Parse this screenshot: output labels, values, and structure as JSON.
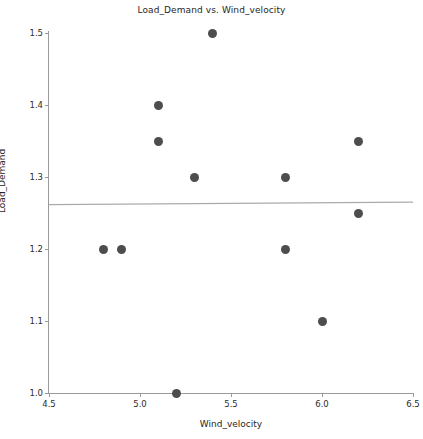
{
  "chart_data": {
    "type": "scatter",
    "title": "Load_Demand vs. Wind_velocity",
    "xlabel": "Wind_velocity",
    "ylabel": "Load_Demand",
    "xlim": [
      4.5,
      6.5
    ],
    "ylim": [
      1.0,
      1.5
    ],
    "xticks": [
      "4.5",
      "5.0",
      "5.5",
      "6.0",
      "6.5"
    ],
    "xtick_values": [
      4.5,
      5.0,
      5.5,
      6.0,
      6.5
    ],
    "yticks": [
      "1.0",
      "1.1",
      "1.2",
      "1.3",
      "1.4",
      "1.5"
    ],
    "ytick_values": [
      1.0,
      1.1,
      1.2,
      1.3,
      1.4,
      1.5
    ],
    "grid": false,
    "legend": "none",
    "marker_color": "#4d4d4d",
    "line_color": "#aaaaaa",
    "axis_color": "#9a9a9a",
    "x": [
      4.8,
      4.9,
      5.1,
      5.1,
      5.2,
      5.3,
      5.4,
      5.8,
      5.8,
      6.0,
      6.2,
      6.2
    ],
    "y": [
      1.2,
      1.2,
      1.4,
      1.35,
      1.0,
      1.3,
      1.5,
      1.3,
      1.2,
      1.1,
      1.35,
      1.25
    ],
    "points": [
      {
        "x": 4.8,
        "y": 1.2
      },
      {
        "x": 4.9,
        "y": 1.2
      },
      {
        "x": 5.1,
        "y": 1.4
      },
      {
        "x": 5.1,
        "y": 1.35
      },
      {
        "x": 5.2,
        "y": 1.0
      },
      {
        "x": 5.3,
        "y": 1.3
      },
      {
        "x": 5.4,
        "y": 1.5
      },
      {
        "x": 5.8,
        "y": 1.3
      },
      {
        "x": 5.8,
        "y": 1.2
      },
      {
        "x": 6.0,
        "y": 1.1
      },
      {
        "x": 6.2,
        "y": 1.35
      },
      {
        "x": 6.2,
        "y": 1.25
      }
    ],
    "trend_line": {
      "x0": 4.5,
      "y0": 1.2615,
      "x1": 6.5,
      "y1": 1.265
    }
  }
}
